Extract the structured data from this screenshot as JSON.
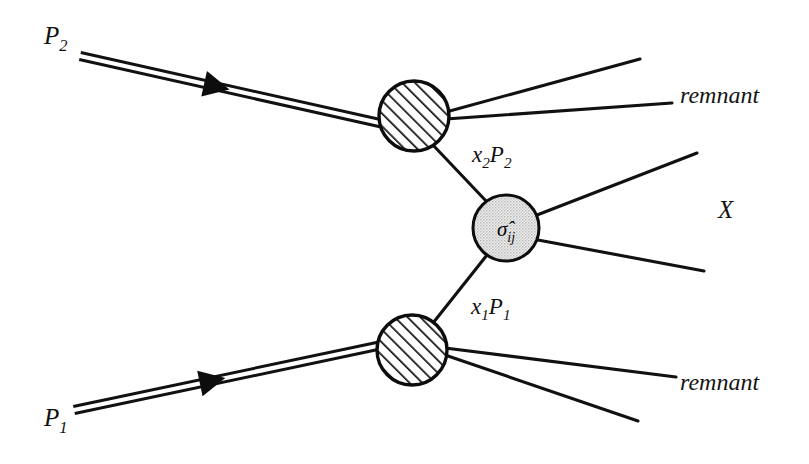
{
  "figure": {
    "type": "feynman-diagram",
    "background_color": "#ffffff",
    "line_color": "#111111"
  },
  "incoming": [
    {
      "id": "p2",
      "label_base": "P",
      "label_sub": "2",
      "label_x": 44,
      "label_y": 44,
      "style": "double-line-with-arrow",
      "from_x": 80,
      "from_y": 56,
      "to_x": 384,
      "to_y": 124,
      "arrow_t": 0.45
    },
    {
      "id": "p1",
      "label_base": "P",
      "label_sub": "1",
      "label_x": 44,
      "label_y": 426,
      "style": "double-line-with-arrow",
      "from_x": 74,
      "from_y": 410,
      "to_x": 382,
      "to_y": 345,
      "arrow_t": 0.45
    }
  ],
  "blobs": [
    {
      "id": "top-hadron-blob",
      "name": "top-proton-blob",
      "fill": "hatch",
      "cx": 414,
      "cy": 116,
      "rx": 35,
      "ry": 35,
      "label": ""
    },
    {
      "id": "hard-scatter-blob",
      "name": "hard-scattering-blob",
      "fill": "stipple",
      "fill_color": "#e4e4e4",
      "cx": 506,
      "cy": 228,
      "rx": 33,
      "ry": 33,
      "label_base": "σ̂",
      "label_sub": "ij"
    },
    {
      "id": "bottom-hadron-blob",
      "name": "bottom-proton-blob",
      "fill": "hatch",
      "cx": 412,
      "cy": 350,
      "rx": 35,
      "ry": 35,
      "label": ""
    }
  ],
  "parton_lines": [
    {
      "id": "x2p2",
      "label_base": "x",
      "label_sub": "2",
      "label_base2": "P",
      "label_sub2": "2",
      "label_x": 472,
      "label_y": 162,
      "from_x": 432,
      "from_y": 144,
      "to_x": 487,
      "to_y": 202
    },
    {
      "id": "x1p1",
      "label_base": "x",
      "label_sub": "1",
      "label_base2": "P",
      "label_sub2": "1",
      "label_x": 471,
      "label_y": 314,
      "from_x": 487,
      "from_y": 255,
      "to_x": 433,
      "to_y": 323
    }
  ],
  "outgoing": [
    {
      "id": "remnant-top-upper",
      "from_x": 446,
      "from_y": 112,
      "to_x": 640,
      "to_y": 59
    },
    {
      "id": "remnant-top-lower",
      "from_x": 446,
      "from_y": 119,
      "to_x": 672,
      "to_y": 103
    },
    {
      "id": "x-upper",
      "from_x": 537,
      "from_y": 215,
      "to_x": 697,
      "to_y": 153
    },
    {
      "id": "x-lower",
      "from_x": 538,
      "from_y": 240,
      "to_x": 704,
      "to_y": 271
    },
    {
      "id": "remnant-bottom-upper",
      "from_x": 445,
      "from_y": 348,
      "to_x": 676,
      "to_y": 377
    },
    {
      "id": "remnant-bottom-lower",
      "from_x": 445,
      "from_y": 355,
      "to_x": 638,
      "to_y": 421
    }
  ],
  "text_labels": [
    {
      "id": "remnant-top",
      "text": "remnant",
      "x": 680,
      "y": 103
    },
    {
      "id": "final-state-x",
      "text": "X",
      "x": 718,
      "y": 218
    },
    {
      "id": "remnant-bottom",
      "text": "remnant",
      "x": 680,
      "y": 390
    }
  ]
}
